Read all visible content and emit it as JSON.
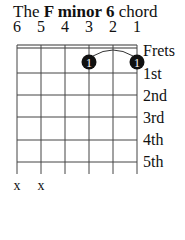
{
  "title": {
    "prefix": "The ",
    "chord": "F minor 6",
    "suffix": " chord"
  },
  "strings": [
    {
      "number": "6",
      "x": 17,
      "state": "x"
    },
    {
      "number": "5",
      "x": 41,
      "state": "x"
    },
    {
      "number": "4",
      "x": 65,
      "state": ""
    },
    {
      "number": "3",
      "x": 89,
      "state": ""
    },
    {
      "number": "2",
      "x": 113,
      "state": ""
    },
    {
      "number": "1",
      "x": 137,
      "state": ""
    }
  ],
  "fret_labels": [
    "Frets",
    "1st",
    "2nd",
    "3rd",
    "4th",
    "5th"
  ],
  "fingers": [
    {
      "string": 3,
      "fret": 1,
      "finger": "1"
    },
    {
      "string": 1,
      "fret": 1,
      "finger": "1"
    }
  ],
  "barre": {
    "from_string": 3,
    "to_string": 1,
    "fret": 1
  },
  "muted_marker": "x",
  "colors": {
    "ink": "#111111",
    "background": "#ffffff",
    "dot_text": "#ffffff"
  }
}
